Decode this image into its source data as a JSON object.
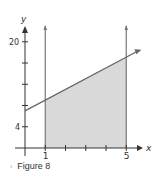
{
  "chart_data": {
    "type": "area",
    "title": "",
    "xlabel": "x",
    "ylabel": "y",
    "x_ticks": [
      1,
      2,
      3,
      4,
      5
    ],
    "x_tick_labels": [
      "1",
      "5"
    ],
    "y_ticks": [
      4,
      8,
      12,
      16,
      20
    ],
    "y_tick_labels": [
      "4",
      "20"
    ],
    "xlim": [
      0,
      5.7
    ],
    "ylim": [
      0,
      22
    ],
    "series": [
      {
        "name": "line",
        "x": [
          0,
          5.7
        ],
        "y": [
          7,
          18.4
        ]
      }
    ],
    "shaded_region": {
      "x_from": 1,
      "x_to": 5,
      "under": "line",
      "color": "#d9d9d9"
    },
    "vertical_lines": [
      1,
      5
    ],
    "grid": false,
    "colors": {
      "axis": "#333333",
      "line": "#666666",
      "fill": "#d9d9d9"
    }
  },
  "caption": {
    "marker": "›",
    "text": "Figure 8"
  }
}
